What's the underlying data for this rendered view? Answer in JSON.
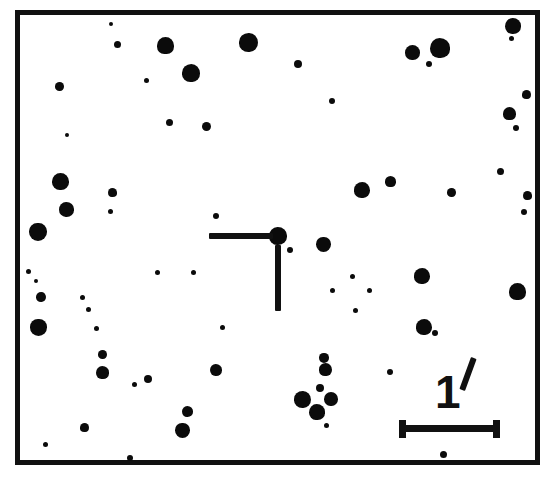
{
  "chart_data": {
    "type": "scatter",
    "title": "",
    "xlabel": "",
    "ylabel": "",
    "grid": false,
    "legend": "none",
    "axis_ranges": {
      "x": [
        0,
        525
      ],
      "y": [
        0,
        455
      ]
    },
    "field_frame": {
      "x": 15,
      "y": 10,
      "width": 525,
      "height": 455,
      "border_px": 5,
      "color": "#111111"
    },
    "background_color": "#ffffff",
    "star_color": "#0b0b0b",
    "marker": {
      "kind": "offset-crosshair",
      "target_x": 278,
      "target_y": 236,
      "horizontal_bar": {
        "x": 209,
        "y": 233,
        "width": 64,
        "height": 6
      },
      "vertical_bar": {
        "x": 275,
        "y": 245,
        "width": 6,
        "height": 66
      }
    },
    "scalebar": {
      "label": "1",
      "unit_symbol": "′",
      "unit_name": "arcminute",
      "length_px": 101,
      "x": 399,
      "y": 425,
      "thickness": 7,
      "cap_height": 18
    },
    "stars": [
      {
        "x": 111,
        "y": 24,
        "r": 2.0
      },
      {
        "x": 117,
        "y": 44,
        "r": 3.5
      },
      {
        "x": 165,
        "y": 45,
        "r": 8.5
      },
      {
        "x": 248,
        "y": 42,
        "r": 9.5
      },
      {
        "x": 412,
        "y": 52,
        "r": 7.5
      },
      {
        "x": 440,
        "y": 48,
        "r": 10.0
      },
      {
        "x": 429,
        "y": 64,
        "r": 3.0
      },
      {
        "x": 513,
        "y": 26,
        "r": 8.0
      },
      {
        "x": 511,
        "y": 38,
        "r": 2.5
      },
      {
        "x": 191,
        "y": 73,
        "r": 9.0
      },
      {
        "x": 146,
        "y": 80,
        "r": 2.5
      },
      {
        "x": 59,
        "y": 86,
        "r": 4.5
      },
      {
        "x": 298,
        "y": 64,
        "r": 4.0
      },
      {
        "x": 169,
        "y": 122,
        "r": 3.5
      },
      {
        "x": 206,
        "y": 126,
        "r": 4.5
      },
      {
        "x": 332,
        "y": 101,
        "r": 3.0
      },
      {
        "x": 67,
        "y": 135,
        "r": 2.0
      },
      {
        "x": 526,
        "y": 94,
        "r": 4.5
      },
      {
        "x": 509,
        "y": 113,
        "r": 6.5
      },
      {
        "x": 516,
        "y": 128,
        "r": 3.0
      },
      {
        "x": 60,
        "y": 181,
        "r": 8.5
      },
      {
        "x": 112,
        "y": 192,
        "r": 4.5
      },
      {
        "x": 110,
        "y": 211,
        "r": 2.5
      },
      {
        "x": 66,
        "y": 209,
        "r": 7.5
      },
      {
        "x": 38,
        "y": 232,
        "r": 9.0
      },
      {
        "x": 362,
        "y": 190,
        "r": 8.0
      },
      {
        "x": 390,
        "y": 181,
        "r": 5.5
      },
      {
        "x": 451,
        "y": 192,
        "r": 4.5
      },
      {
        "x": 500,
        "y": 171,
        "r": 3.5
      },
      {
        "x": 527,
        "y": 195,
        "r": 4.5
      },
      {
        "x": 524,
        "y": 212,
        "r": 3.0
      },
      {
        "x": 216,
        "y": 216,
        "r": 3.0
      },
      {
        "x": 323,
        "y": 244,
        "r": 7.5
      },
      {
        "x": 290,
        "y": 250,
        "r": 3.0
      },
      {
        "x": 28,
        "y": 271,
        "r": 2.5
      },
      {
        "x": 36,
        "y": 281,
        "r": 2.0
      },
      {
        "x": 157,
        "y": 272,
        "r": 2.5
      },
      {
        "x": 193,
        "y": 272,
        "r": 2.5
      },
      {
        "x": 352,
        "y": 276,
        "r": 2.5
      },
      {
        "x": 332,
        "y": 290,
        "r": 2.5
      },
      {
        "x": 369,
        "y": 290,
        "r": 2.5
      },
      {
        "x": 422,
        "y": 276,
        "r": 8.0
      },
      {
        "x": 517,
        "y": 291,
        "r": 8.5
      },
      {
        "x": 41,
        "y": 297,
        "r": 5.0
      },
      {
        "x": 82,
        "y": 297,
        "r": 2.5
      },
      {
        "x": 88,
        "y": 309,
        "r": 2.5
      },
      {
        "x": 222,
        "y": 327,
        "r": 2.5
      },
      {
        "x": 96,
        "y": 328,
        "r": 2.5
      },
      {
        "x": 38,
        "y": 327,
        "r": 8.5
      },
      {
        "x": 424,
        "y": 327,
        "r": 8.0
      },
      {
        "x": 435,
        "y": 333,
        "r": 3.0
      },
      {
        "x": 102,
        "y": 354,
        "r": 4.5
      },
      {
        "x": 148,
        "y": 379,
        "r": 4.0
      },
      {
        "x": 102,
        "y": 372,
        "r": 6.5
      },
      {
        "x": 134,
        "y": 384,
        "r": 2.5
      },
      {
        "x": 216,
        "y": 370,
        "r": 6.0
      },
      {
        "x": 324,
        "y": 358,
        "r": 5.0
      },
      {
        "x": 325,
        "y": 369,
        "r": 6.5
      },
      {
        "x": 320,
        "y": 388,
        "r": 4.0
      },
      {
        "x": 302,
        "y": 399,
        "r": 8.5
      },
      {
        "x": 331,
        "y": 399,
        "r": 7.0
      },
      {
        "x": 317,
        "y": 412,
        "r": 8.0
      },
      {
        "x": 326,
        "y": 425,
        "r": 2.5
      },
      {
        "x": 187,
        "y": 411,
        "r": 5.5
      },
      {
        "x": 182,
        "y": 430,
        "r": 7.5
      },
      {
        "x": 84,
        "y": 427,
        "r": 4.5
      },
      {
        "x": 45,
        "y": 444,
        "r": 2.5
      },
      {
        "x": 130,
        "y": 458,
        "r": 3.0
      },
      {
        "x": 390,
        "y": 372,
        "r": 3.0
      },
      {
        "x": 355,
        "y": 310,
        "r": 2.5
      },
      {
        "x": 443,
        "y": 454,
        "r": 3.5
      },
      {
        "x": 278,
        "y": 236,
        "r": 9.0
      }
    ]
  }
}
